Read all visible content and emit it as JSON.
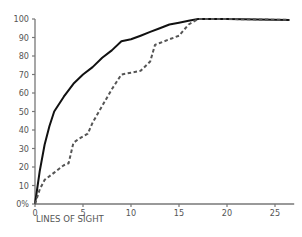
{
  "chart_data": {
    "type": "line",
    "title": "",
    "xlabel": "LINES OF SIGHT",
    "ylabel": "",
    "xlim": [
      0,
      27
    ],
    "ylim": [
      0,
      100
    ],
    "grid": false,
    "legend": null,
    "x_ticks": [
      0,
      5,
      10,
      15,
      20,
      25
    ],
    "y_ticks": [
      0,
      10,
      20,
      30,
      40,
      50,
      60,
      70,
      80,
      90,
      100
    ],
    "y_tick_labels": [
      "0%",
      "10",
      "20",
      "30",
      "40",
      "50",
      "60",
      "70",
      "80",
      "90",
      "100"
    ],
    "series": [
      {
        "name": "solid",
        "style": "solid",
        "color": "#111111",
        "points": [
          [
            0,
            0
          ],
          [
            0.5,
            18
          ],
          [
            1,
            32
          ],
          [
            1.5,
            42
          ],
          [
            2,
            50
          ],
          [
            3,
            58
          ],
          [
            4,
            65
          ],
          [
            5,
            70
          ],
          [
            6,
            74
          ],
          [
            7,
            79
          ],
          [
            8,
            83
          ],
          [
            9,
            88
          ],
          [
            10,
            89
          ],
          [
            11,
            91
          ],
          [
            12,
            93
          ],
          [
            13,
            95
          ],
          [
            14,
            97
          ],
          [
            15,
            98
          ],
          [
            16,
            99
          ],
          [
            17,
            100
          ],
          [
            20,
            100
          ],
          [
            26.5,
            99.5
          ]
        ]
      },
      {
        "name": "dashed",
        "style": "dashed",
        "color": "#555555",
        "points": [
          [
            0,
            0
          ],
          [
            0.5,
            8
          ],
          [
            1,
            13
          ],
          [
            2,
            17
          ],
          [
            3,
            21
          ],
          [
            3.5,
            22
          ],
          [
            4,
            33
          ],
          [
            4.5,
            35
          ],
          [
            5.5,
            38
          ],
          [
            6,
            44
          ],
          [
            7,
            53
          ],
          [
            8,
            62
          ],
          [
            9,
            70
          ],
          [
            10,
            71
          ],
          [
            11,
            72
          ],
          [
            12,
            77
          ],
          [
            12.5,
            86
          ],
          [
            13,
            87
          ],
          [
            14,
            89
          ],
          [
            15,
            91
          ],
          [
            16,
            97
          ],
          [
            17,
            100
          ],
          [
            20,
            100
          ],
          [
            26.5,
            99.5
          ]
        ]
      }
    ]
  },
  "axis_color": "#777777"
}
